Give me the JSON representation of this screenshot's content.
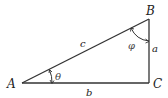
{
  "diagram": {
    "type": "right-triangle",
    "vertices": {
      "A": {
        "label": "A"
      },
      "B": {
        "label": "B"
      },
      "C": {
        "label": "C"
      }
    },
    "sides": {
      "hypotenuse": {
        "label": "c"
      },
      "opposite": {
        "label": "a"
      },
      "adjacent": {
        "label": "b"
      }
    },
    "angles": {
      "at_A": {
        "label": "θ"
      },
      "at_B": {
        "label": "φ"
      }
    },
    "colors": {
      "stroke": "#333333",
      "text": "#222222"
    }
  }
}
